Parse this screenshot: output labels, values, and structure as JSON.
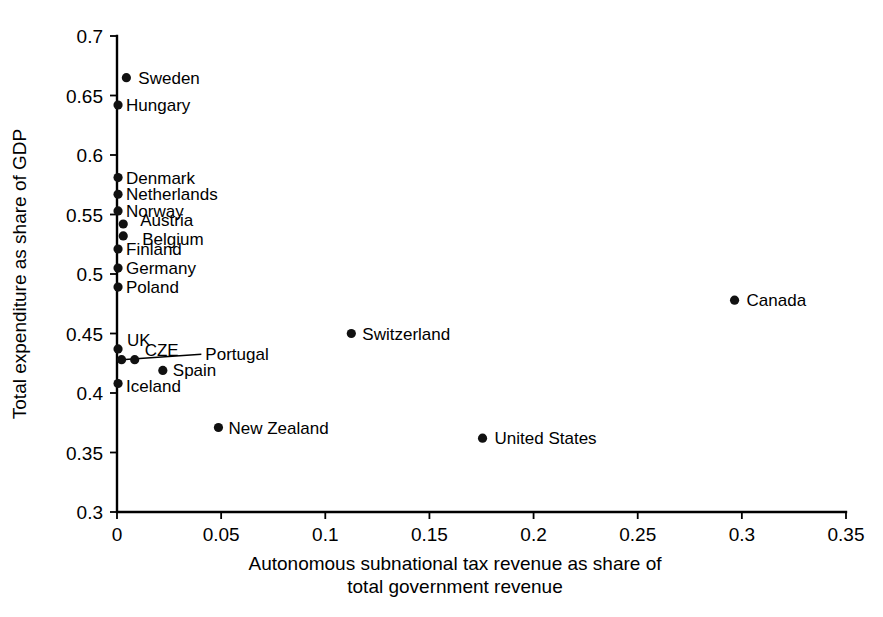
{
  "chart_data": {
    "type": "scatter",
    "title": "",
    "xlabel": "Autonomous subnational tax revenue as share of total government revenue",
    "xlabel_line1": "Autonomous subnational tax revenue as share of",
    "xlabel_line2": "total government revenue",
    "ylabel": "Total expenditure as share of GDP",
    "xlim": [
      0,
      0.35
    ],
    "ylim": [
      0.3,
      0.7
    ],
    "xticks": [
      0,
      0.05,
      0.1,
      0.15,
      0.2,
      0.25,
      0.3,
      0.35
    ],
    "xtick_labels": [
      "0",
      "0.05",
      "0.1",
      "0.15",
      "0.2",
      "0.25",
      "0.3",
      "0.35"
    ],
    "yticks": [
      0.3,
      0.35,
      0.4,
      0.45,
      0.5,
      0.55,
      0.6,
      0.65,
      0.7
    ],
    "ytick_labels": [
      "0.3",
      "0.35",
      "0.4",
      "0.45",
      "0.5",
      "0.55",
      "0.6",
      "0.65",
      "0.7"
    ],
    "grid": false,
    "legend": false,
    "marker_color": "#111111",
    "points": [
      {
        "name": "Sweden",
        "x": 0.0045,
        "y": 0.665,
        "label_dx": 12,
        "label_dy": 6,
        "anchor": "start"
      },
      {
        "name": "Hungary",
        "x": 0.0005,
        "y": 0.642,
        "label_dx": 8,
        "label_dy": 6,
        "anchor": "start"
      },
      {
        "name": "Denmark",
        "x": 0.0005,
        "y": 0.581,
        "label_dx": 8,
        "label_dy": 6,
        "anchor": "start"
      },
      {
        "name": "Netherlands",
        "x": 0.0005,
        "y": 0.567,
        "label_dx": 8,
        "label_dy": 6,
        "anchor": "start"
      },
      {
        "name": "Norway",
        "x": 0.0005,
        "y": 0.553,
        "label_dx": 8,
        "label_dy": 6,
        "anchor": "start"
      },
      {
        "name": "Austria",
        "x": 0.003,
        "y": 0.542,
        "label_dx": 17,
        "label_dy": 2,
        "anchor": "start"
      },
      {
        "name": "Belgium",
        "x": 0.003,
        "y": 0.532,
        "label_dx": 19,
        "label_dy": 9,
        "anchor": "start"
      },
      {
        "name": "Finland",
        "x": 0.0005,
        "y": 0.521,
        "label_dx": 8,
        "label_dy": 6,
        "anchor": "start"
      },
      {
        "name": "Germany",
        "x": 0.0005,
        "y": 0.505,
        "label_dx": 8,
        "label_dy": 6,
        "anchor": "start"
      },
      {
        "name": "Poland",
        "x": 0.0005,
        "y": 0.489,
        "label_dx": 8,
        "label_dy": 6,
        "anchor": "start"
      },
      {
        "name": "Canada",
        "x": 0.2965,
        "y": 0.478,
        "label_dx": 12,
        "label_dy": 6,
        "anchor": "start"
      },
      {
        "name": "Switzerland",
        "x": 0.1125,
        "y": 0.45,
        "label_dx": 11,
        "label_dy": 6,
        "anchor": "start"
      },
      {
        "name": "UK",
        "x": 0.0005,
        "y": 0.437,
        "label_dx": 9,
        "label_dy": -3,
        "anchor": "start"
      },
      {
        "name": "CZE",
        "x": 0.0085,
        "y": 0.428,
        "label_dx": 10,
        "label_dy": -4,
        "anchor": "start"
      },
      {
        "name": "Portugal",
        "x": 0.0022,
        "y": 0.428,
        "label_dx": 0,
        "label_dy": 0,
        "anchor": "start",
        "leader": true,
        "label_x": 0.0405,
        "label_y": 0.4325
      },
      {
        "name": "Spain",
        "x": 0.022,
        "y": 0.419,
        "label_dx": 10,
        "label_dy": 6,
        "anchor": "start"
      },
      {
        "name": "Iceland",
        "x": 0.0005,
        "y": 0.408,
        "label_dx": 8,
        "label_dy": 9,
        "anchor": "start"
      },
      {
        "name": "New Zealand",
        "x": 0.0487,
        "y": 0.371,
        "label_dx": 10,
        "label_dy": 6,
        "anchor": "start"
      },
      {
        "name": "United States",
        "x": 0.1755,
        "y": 0.362,
        "label_dx": 12,
        "label_dy": 6,
        "anchor": "start"
      }
    ]
  }
}
